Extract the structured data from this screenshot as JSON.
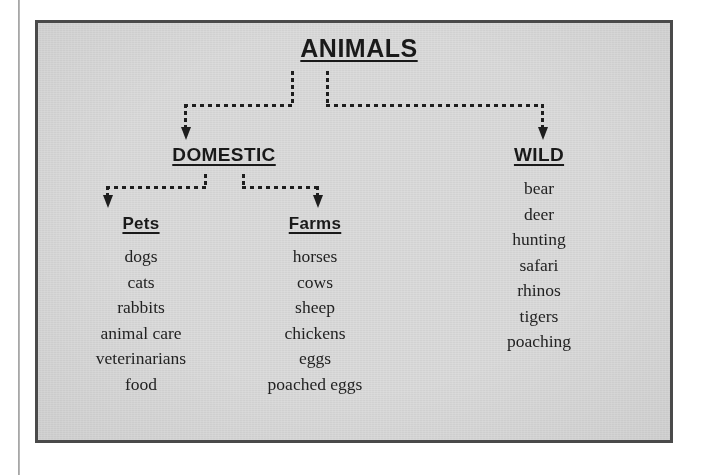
{
  "diagram": {
    "type": "hierarchy-tree",
    "title": "ANIMALS",
    "background_color": "#dcdcdc",
    "border_color": "#4a4a4a",
    "text_color": "#1d1d1d",
    "connector_style": "dotted-arrow",
    "root": {
      "label": "ANIMALS",
      "level": 1
    },
    "branches": [
      {
        "label": "DOMESTIC",
        "level": 2,
        "children": [
          {
            "label": "Pets",
            "level": 3,
            "items": [
              "dogs",
              "cats",
              "rabbits",
              "animal care",
              "veterinarians",
              "food"
            ]
          },
          {
            "label": "Farms",
            "level": 3,
            "items": [
              "horses",
              "cows",
              "sheep",
              "chickens",
              "eggs",
              "poached eggs"
            ]
          }
        ]
      },
      {
        "label": "WILD",
        "level": 2,
        "children": [],
        "items": [
          "bear",
          "deer",
          "hunting",
          "safari",
          "rhinos",
          "tigers",
          "poaching"
        ]
      }
    ]
  }
}
